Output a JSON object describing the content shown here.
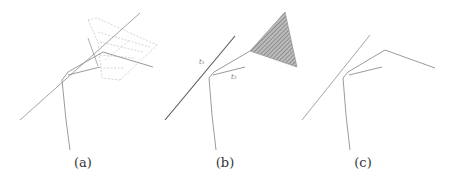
{
  "figure": {
    "panels": [
      {
        "id": "a",
        "caption": "(a)"
      },
      {
        "id": "b",
        "caption": "(b)",
        "labels": {
          "t1": "t₁",
          "t2": "t₂"
        }
      },
      {
        "id": "c",
        "caption": "(c)"
      }
    ]
  },
  "colors": {
    "line": "#8a8a8a",
    "dark_line": "#555555",
    "dotted": "#c8c8c8",
    "hatch": "#888888"
  }
}
